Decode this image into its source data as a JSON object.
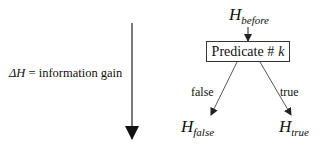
{
  "diagram": {
    "gain_label": {
      "symbol": "ΔH",
      "text": " = information gain"
    },
    "root": {
      "base": "H",
      "subscript": "before"
    },
    "predicate": {
      "text": "Predicate #",
      "var": "k"
    },
    "edges": [
      {
        "label": "false",
        "to": "H_false"
      },
      {
        "label": "true",
        "to": "H_true"
      }
    ],
    "leaves": [
      {
        "base": "H",
        "subscript": "false"
      },
      {
        "base": "H",
        "subscript": "true"
      }
    ],
    "colors": {
      "line": "#333333",
      "text": "#111111",
      "background": "#ffffff"
    }
  }
}
